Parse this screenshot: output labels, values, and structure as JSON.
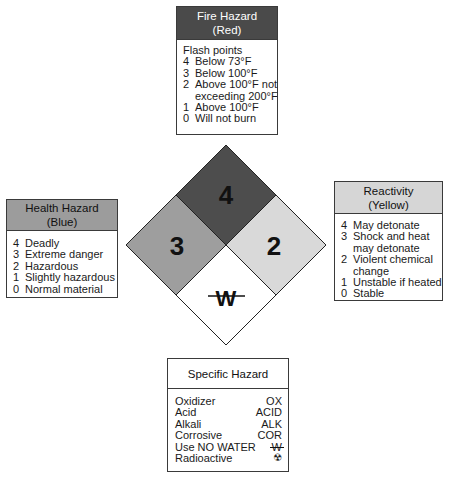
{
  "fire": {
    "title": "Fire Hazard",
    "subtitle": "(Red)",
    "color": "#4a4a4a",
    "lead": "Flash points",
    "items": [
      {
        "num": "4",
        "text": "Below 73°F",
        "cont": ""
      },
      {
        "num": "3",
        "text": "Below 100°F",
        "cont": ""
      },
      {
        "num": "2",
        "text": "Above 100°F not",
        "cont": "exceeding 200°F"
      },
      {
        "num": "1",
        "text": "Above 100°F",
        "cont": ""
      },
      {
        "num": "0",
        "text": "Will not burn",
        "cont": ""
      }
    ]
  },
  "health": {
    "title": "Health Hazard",
    "subtitle": "(Blue)",
    "color": "#9c9c9c",
    "items": [
      {
        "num": "4",
        "text": "Deadly"
      },
      {
        "num": "3",
        "text": "Extreme danger"
      },
      {
        "num": "2",
        "text": "Hazardous"
      },
      {
        "num": "1",
        "text": "Slightly hazardous"
      },
      {
        "num": "0",
        "text": "Normal material"
      }
    ]
  },
  "reactivity": {
    "title": "Reactivity",
    "subtitle": "(Yellow)",
    "color": "#d6d6d6",
    "items": [
      {
        "num": "4",
        "text": "May detonate",
        "cont": ""
      },
      {
        "num": "3",
        "text": "Shock and heat",
        "cont": "may detonate"
      },
      {
        "num": "2",
        "text": "Violent chemical",
        "cont": "change"
      },
      {
        "num": "1",
        "text": "Unstable if heated",
        "cont": ""
      },
      {
        "num": "0",
        "text": "Stable",
        "cont": ""
      }
    ]
  },
  "specific": {
    "title": "Specific Hazard",
    "items": [
      {
        "label": "Oxidizer",
        "code": "OX"
      },
      {
        "label": "Acid",
        "code": "ACID"
      },
      {
        "label": "Alkali",
        "code": "ALK"
      },
      {
        "label": "Corrosive",
        "code": "COR"
      },
      {
        "label": "Use NO WATER",
        "code": "W",
        "icon": "no-water-icon"
      },
      {
        "label": "Radioactive",
        "code": "☢",
        "icon": "radiation-icon"
      }
    ]
  },
  "diamond": {
    "fire_value": "4",
    "health_value": "3",
    "reactivity_value": "2",
    "special_value": "W",
    "colors": {
      "fire": "#4d4d4d",
      "health": "#9e9e9e",
      "reactivity": "#d9d9d9",
      "special": "#ffffff"
    }
  }
}
